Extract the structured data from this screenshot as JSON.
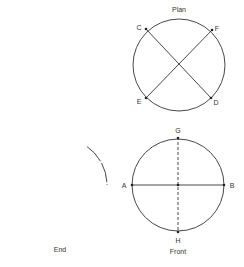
{
  "views": {
    "plan": {
      "title": "Plan",
      "points": {
        "C": "C",
        "F": "F",
        "E": "E",
        "D": "D"
      }
    },
    "end": {
      "title": "End"
    },
    "front": {
      "title": "Front",
      "points": {
        "A": "A",
        "B": "B",
        "G": "G",
        "H": "H"
      }
    }
  },
  "colors": {
    "stroke": "#333333",
    "background": "#ffffff"
  }
}
